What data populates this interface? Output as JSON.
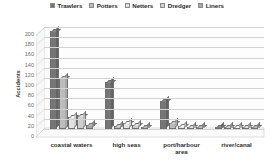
{
  "chart_data": {
    "type": "bar",
    "title": "",
    "xlabel": "",
    "ylabel": "Accidents",
    "ylim": [
      0,
      200
    ],
    "ytick_step": 20,
    "grid": true,
    "legend_position": "top-center",
    "style": "3d-clustered-column",
    "categories": [
      "coastal waters",
      "high seas",
      "port/harbour\narea",
      "river/canal"
    ],
    "series": [
      {
        "name": "Trawlers",
        "color": "#757575",
        "values": [
          193,
          93,
          55,
          3
        ]
      },
      {
        "name": "Potters",
        "color": "#bcbcbc",
        "values": [
          101,
          5,
          12,
          2
        ]
      },
      {
        "name": "Netters",
        "color": "#e3e3e3",
        "values": [
          24,
          12,
          5,
          3
        ]
      },
      {
        "name": "Dredger",
        "color": "#cfcfcf",
        "values": [
          25,
          8,
          4,
          2
        ]
      },
      {
        "name": "Liners",
        "color": "#a8a8a8",
        "values": [
          8,
          4,
          3,
          2
        ]
      }
    ],
    "ytick_labels": [
      "0",
      "20",
      "40",
      "60",
      "80",
      "100",
      "120",
      "140",
      "160",
      "180",
      "200"
    ]
  },
  "legend": {
    "entries": [
      {
        "label": "Trawlers",
        "swatch": "legend-swatch-trawlers"
      },
      {
        "label": "Potters",
        "swatch": "legend-swatch-potters"
      },
      {
        "label": "Netters",
        "swatch": "legend-swatch-netters"
      },
      {
        "label": "Dredger",
        "swatch": "legend-swatch-dredger"
      },
      {
        "label": "Liners",
        "swatch": "legend-swatch-liners"
      }
    ]
  },
  "axes": {
    "y_title": "Accidents"
  }
}
